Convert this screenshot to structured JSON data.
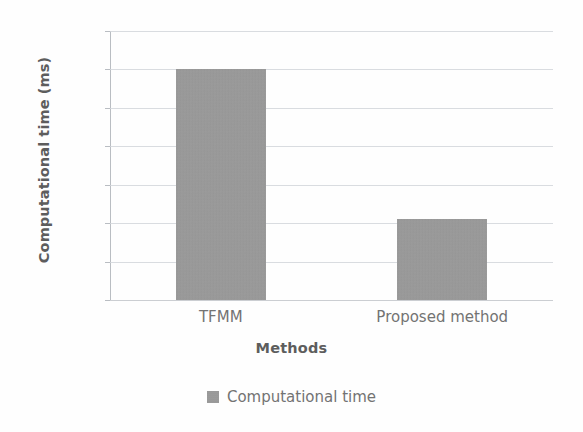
{
  "chart_data": {
    "type": "bar",
    "title": "",
    "subtitle": "",
    "categories": [
      "TFMM",
      "Proposed method"
    ],
    "values": [
      22.0,
      20.05
    ],
    "series": [
      {
        "name": "Computational time",
        "values": [
          22.0,
          20.05
        ],
        "color": "#9a9a9a"
      }
    ],
    "xlabel": "Methods",
    "ylabel": "Computational time (ms)",
    "ylim": [
      19,
      22.5
    ],
    "ytick_labels": [
      "19",
      "19.5",
      "20",
      "20.5",
      "21",
      "21.5",
      "22",
      "22.5"
    ],
    "ytick_values": [
      19,
      19.5,
      20,
      20.5,
      21,
      21.5,
      22,
      22.5
    ],
    "grid": true,
    "grid_axis": "y",
    "legend": {
      "position": "bottom",
      "entries": [
        {
          "label": "Computational time",
          "color": "#9a9a9a",
          "marker": "square"
        }
      ]
    },
    "colors": {
      "bar_fill": "#9a9a9a",
      "gridline": "#d2d6da",
      "axis_line": "#b9bdc2",
      "tick_text": "#6b6b6b",
      "title_text": "#5d5d5d",
      "background": "#fefefe"
    }
  }
}
